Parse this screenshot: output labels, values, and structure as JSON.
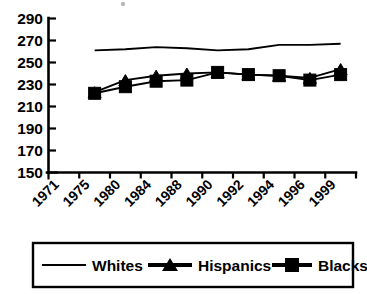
{
  "chart_data": {
    "type": "line",
    "title": "",
    "subtitle": "",
    "xlabel": "",
    "ylabel": "",
    "categories": [
      "1971",
      "1975",
      "1980",
      "1984",
      "1988",
      "1990",
      "1992",
      "1994",
      "1996",
      "1999"
    ],
    "x_tick_labels": [
      "1971",
      "1975",
      "1980",
      "1984",
      "1988",
      "1990",
      "1992",
      "1994",
      "1996",
      "1999"
    ],
    "y_tick_labels": [
      "290",
      "270",
      "250",
      "230",
      "210",
      "190",
      "170",
      "150"
    ],
    "ylim": [
      150,
      290
    ],
    "ytick_step": 20,
    "grid": false,
    "legend_position": "bottom",
    "series": [
      {
        "name": "Whites",
        "marker": "none",
        "color": "#000000",
        "values": [
          null,
          261,
          262,
          264,
          263,
          261,
          262,
          266,
          266,
          267
        ]
      },
      {
        "name": "Hispanics",
        "marker": "triangle",
        "color": "#000000",
        "values": [
          null,
          223,
          234,
          238,
          240,
          241,
          239,
          238,
          236,
          244
        ]
      },
      {
        "name": "Blacks",
        "marker": "square",
        "color": "#000000",
        "values": [
          null,
          222,
          228,
          233,
          234,
          241,
          239,
          238,
          234,
          239
        ]
      }
    ]
  },
  "legend": {
    "items": [
      {
        "label": "Whites",
        "marker": "line"
      },
      {
        "label": "Hispanics",
        "marker": "triangle"
      },
      {
        "label": "Blacks",
        "marker": "square"
      }
    ]
  }
}
